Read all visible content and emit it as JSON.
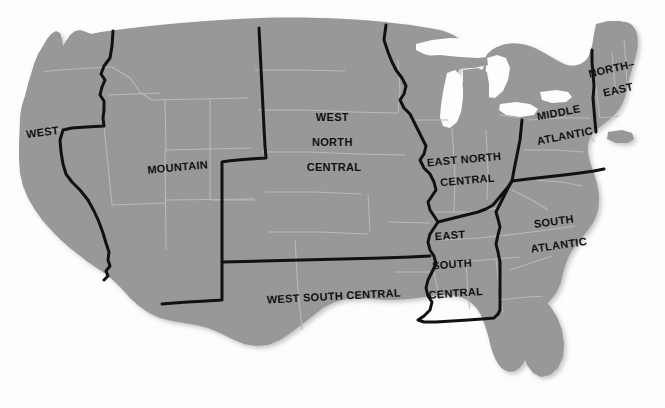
{
  "map": {
    "title": "United States Census Divisions Map",
    "subject": "Contiguous United States",
    "background_color": "#fdfdfd",
    "land_fill_color": "#989898",
    "land_fill_shadow_color": "#8c8c8c",
    "state_border_color": "#b9b9b9",
    "division_border_color": "#111111",
    "division_border_width_px": 3,
    "label_color": "#111111",
    "label_font_size_px": 11,
    "width_px": 665,
    "height_px": 408
  },
  "labels": [
    {
      "id": "west",
      "name": "west-label",
      "lines": [
        "WEST"
      ],
      "x": 43,
      "y": 136,
      "rotation": -8
    },
    {
      "id": "mountain",
      "name": "mountain-label",
      "lines": [
        "MOUNTAIN"
      ],
      "x": 178,
      "y": 171,
      "rotation": -5
    },
    {
      "id": "west-north-central",
      "name": "west-north-central-label",
      "lines": [
        "WEST",
        "NORTH",
        "CENTRAL"
      ],
      "x": 334,
      "y": 121,
      "rotation": 0
    },
    {
      "id": "east-north-central",
      "name": "east-north-central-label",
      "lines": [
        "EAST NORTH",
        "CENTRAL"
      ],
      "x": 466,
      "y": 163,
      "rotation": -5
    },
    {
      "id": "middle-atlantic",
      "name": "middle-atlantic-label",
      "lines": [
        "MIDDLE",
        "ATLANTIC"
      ],
      "x": 561,
      "y": 116,
      "rotation": -11
    },
    {
      "id": "north-east",
      "name": "north-east-label",
      "lines": [
        "NORTH–",
        "EAST"
      ],
      "x": 614,
      "y": 72,
      "rotation": -13
    },
    {
      "id": "west-south-central",
      "name": "west-south-central-label",
      "lines": [
        "WEST SOUTH CENTRAL"
      ],
      "x": 334,
      "y": 300,
      "rotation": -3
    },
    {
      "id": "east-south-central",
      "name": "east-south-central-label",
      "lines": [
        "EAST",
        "SOUTH",
        "CENTRAL"
      ],
      "x": 452,
      "y": 239,
      "rotation": -4
    },
    {
      "id": "south-atlantic",
      "name": "south-atlantic-label",
      "lines": [
        "SOUTH",
        "ATLANTIC"
      ],
      "x": 556,
      "y": 225,
      "rotation": -8
    }
  ],
  "divisions": [
    "West",
    "Mountain",
    "West North Central",
    "East North Central",
    "Middle Atlantic",
    "North–East",
    "West South Central",
    "East South Central",
    "South Atlantic"
  ]
}
